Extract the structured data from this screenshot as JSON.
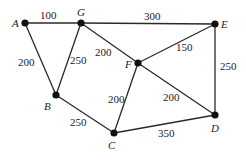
{
  "graph": {
    "nodes": [
      {
        "id": "A",
        "label": "A"
      },
      {
        "id": "G",
        "label": "G"
      },
      {
        "id": "E",
        "label": "E"
      },
      {
        "id": "F",
        "label": "F"
      },
      {
        "id": "B",
        "label": "B"
      },
      {
        "id": "C",
        "label": "C"
      },
      {
        "id": "D",
        "label": "D"
      }
    ],
    "edges": [
      {
        "from": "A",
        "to": "G",
        "weight": "100"
      },
      {
        "from": "G",
        "to": "E",
        "weight": "300"
      },
      {
        "from": "A",
        "to": "B",
        "weight": "200"
      },
      {
        "from": "G",
        "to": "B",
        "weight": "250"
      },
      {
        "from": "G",
        "to": "F",
        "weight": "200"
      },
      {
        "from": "F",
        "to": "E",
        "weight": "150"
      },
      {
        "from": "E",
        "to": "D",
        "weight": "250"
      },
      {
        "from": "F",
        "to": "C",
        "weight": "200"
      },
      {
        "from": "F",
        "to": "D",
        "weight": "200"
      },
      {
        "from": "B",
        "to": "C",
        "weight": "250"
      },
      {
        "from": "C",
        "to": "D",
        "weight": "350"
      }
    ]
  }
}
